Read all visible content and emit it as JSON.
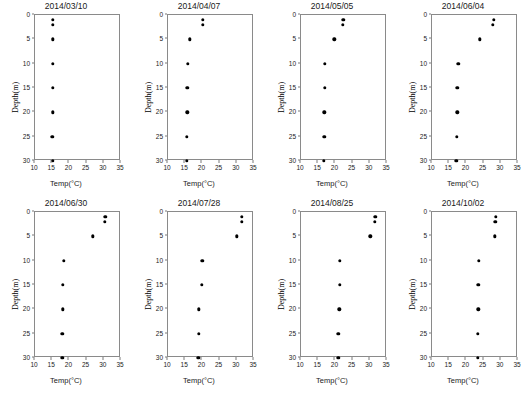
{
  "figure": {
    "xlabel": "Temp(°C)",
    "ylabel": "Depth(m)",
    "columns": 4,
    "rows": 2
  },
  "chart_data": {
    "type": "scatter",
    "title": "",
    "xlabel": "Temp(°C)",
    "ylabel": "Depth(m)",
    "xlim": [
      10,
      35
    ],
    "ylim": [
      30,
      0
    ],
    "y_inverted": true,
    "xticks": [
      10,
      15,
      20,
      25,
      30,
      35
    ],
    "yticks": [
      0,
      5,
      10,
      15,
      20,
      25,
      30
    ],
    "grid": false,
    "legend": "none",
    "marker": "filled-circle",
    "marker_color": "#000000",
    "panels": [
      {
        "title": "2014/03/10",
        "depths": [
          1,
          2,
          5,
          10,
          15,
          20,
          25,
          30
        ],
        "temps": [
          15.2,
          15.2,
          15.2,
          15.2,
          15.2,
          15.1,
          15.0,
          15.1
        ]
      },
      {
        "title": "2014/04/07",
        "depths": [
          1,
          2,
          5,
          10,
          15,
          20,
          25,
          30
        ],
        "temps": [
          20.2,
          20.1,
          16.3,
          15.8,
          15.6,
          15.6,
          15.5,
          15.5
        ]
      },
      {
        "title": "2014/05/05",
        "depths": [
          1,
          2,
          5,
          10,
          15,
          20,
          25,
          30
        ],
        "temps": [
          22.3,
          22.2,
          19.7,
          16.9,
          16.9,
          16.8,
          16.8,
          16.6
        ]
      },
      {
        "title": "2014/06/04",
        "depths": [
          1,
          2,
          5,
          10,
          15,
          20,
          25,
          30
        ],
        "temps": [
          27.9,
          27.7,
          23.9,
          17.6,
          17.3,
          17.3,
          17.2,
          17.1
        ]
      },
      {
        "title": "2014/06/30",
        "depths": [
          1,
          2,
          5,
          10,
          15,
          20,
          25,
          30
        ],
        "temps": [
          30.4,
          30.3,
          26.8,
          18.3,
          18.0,
          18.1,
          17.9,
          17.9
        ]
      },
      {
        "title": "2014/07/28",
        "depths": [
          1,
          2,
          5,
          10,
          15,
          20,
          25,
          30
        ],
        "temps": [
          31.5,
          31.4,
          30.0,
          20.0,
          19.8,
          19.0,
          18.9,
          18.8
        ]
      },
      {
        "title": "2014/08/25",
        "depths": [
          1,
          2,
          5,
          10,
          15,
          20,
          25,
          30
        ],
        "temps": [
          31.6,
          31.5,
          30.1,
          21.3,
          21.2,
          21.1,
          20.9,
          20.8
        ]
      },
      {
        "title": "2014/10/02",
        "depths": [
          1,
          2,
          5,
          10,
          15,
          20,
          25,
          30
        ],
        "temps": [
          28.5,
          28.4,
          28.3,
          23.6,
          23.5,
          23.5,
          23.4,
          23.4
        ]
      }
    ]
  }
}
